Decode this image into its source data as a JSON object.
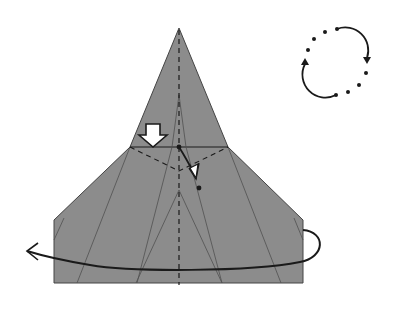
{
  "diagram": {
    "paper_color": "#8c8c8c",
    "line_color": "#1a1a1a",
    "crease_color": "#555555",
    "background": "#ffffff",
    "symbols": {
      "rotation": "turn-over-rotate-icon",
      "push": "push-arrow-icon",
      "fold": "fold-arrow-icon",
      "turn_over": "turn-over-arrow-icon"
    },
    "geometry": {
      "apex": [
        179,
        28
      ],
      "shoulder_line_y": 147,
      "shoulder_left_x": 130,
      "shoulder_right_x": 228,
      "body_left_x": 54,
      "body_right_x": 303,
      "body_top_y": 220,
      "bottom_y": 283,
      "valley_v_bottom": [
        179,
        171
      ],
      "fold_target_dot": [
        199,
        187
      ],
      "rotation_center": [
        336,
        62
      ]
    }
  }
}
